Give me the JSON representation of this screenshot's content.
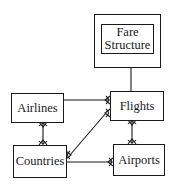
{
  "diagram": {
    "type": "entity-relationship",
    "entities": [
      {
        "id": "fare_structure",
        "label_line1": "Fare",
        "label_line2": "Structure",
        "kind": "weak-entity"
      },
      {
        "id": "airlines",
        "label": "Airlines",
        "kind": "entity"
      },
      {
        "id": "flights",
        "label": "Flights",
        "kind": "entity"
      },
      {
        "id": "countries",
        "label": "Countries",
        "kind": "entity"
      },
      {
        "id": "airports",
        "label": "Airports",
        "kind": "entity"
      }
    ],
    "relationships": [
      {
        "from": "Flights",
        "to": "Fare Structure",
        "many_end": "Fare Structure"
      },
      {
        "from": "Airlines",
        "to": "Flights",
        "many_end": "Flights"
      },
      {
        "from": "Countries",
        "to": "Flights",
        "many_end": "both"
      },
      {
        "from": "Airlines",
        "to": "Countries",
        "many_end": "both"
      },
      {
        "from": "Flights",
        "to": "Airports",
        "many_end": "both"
      },
      {
        "from": "Countries",
        "to": "Airports",
        "many_end": "Airports"
      }
    ],
    "colors": {
      "stroke": "#1a1a1a",
      "background": "#ffffff"
    }
  }
}
